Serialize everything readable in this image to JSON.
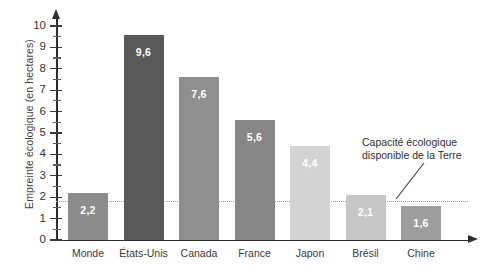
{
  "chart_data": {
    "type": "bar",
    "title": "",
    "xlabel": "",
    "ylabel": "Empreinte écologique (en hectares)",
    "ylim": [
      0,
      10
    ],
    "ytick_labels": [
      "0",
      "1",
      "2",
      "3",
      "4",
      "5",
      "6",
      "7",
      "8",
      "9",
      "10"
    ],
    "minor_tick_step": 0.5,
    "grid": false,
    "legend": "none",
    "categories": [
      "Monde",
      "États-Unis",
      "Canada",
      "France",
      "Japon",
      "Brésil",
      "Chine"
    ],
    "values": [
      2.2,
      9.6,
      7.6,
      5.6,
      4.4,
      2.1,
      1.6
    ],
    "value_labels": [
      "2,2",
      "9,6",
      "7,6",
      "5,6",
      "4,4",
      "2,1",
      "1,6"
    ],
    "bar_colors": [
      "#8c8c8c",
      "#595959",
      "#8f8f8f",
      "#878787",
      "#d3d3d3",
      "#c6c6c6",
      "#9d9d9d"
    ],
    "reference_line": {
      "value": 1.8,
      "label_line_1": "Capacité écologique",
      "label_line_2": "disponible de la Terre",
      "color": "#9a9a9a",
      "style": "dotted"
    }
  }
}
